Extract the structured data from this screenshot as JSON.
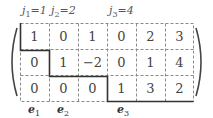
{
  "pivot_labels": [
    {
      "var": "j",
      "sub": "1",
      "eq": "=1",
      "x": 22
    },
    {
      "var": "j",
      "sub": "2",
      "eq": "=2",
      "x": 51
    },
    {
      "var": "j",
      "sub": "3",
      "eq": "=4",
      "x": 109
    }
  ],
  "matrix": {
    "rows": [
      [
        "1",
        "0",
        "1",
        "0",
        "2",
        "3"
      ],
      [
        "0",
        "1",
        "−2",
        "0",
        "1",
        "4"
      ],
      [
        "0",
        "0",
        "0",
        "1",
        "3",
        "2"
      ]
    ]
  },
  "basis_labels": [
    {
      "var": "e",
      "sub": "1",
      "x": 28
    },
    {
      "var": "e",
      "sub": "2",
      "x": 57
    },
    {
      "var": "e",
      "sub": "3",
      "x": 117
    }
  ],
  "colors": {
    "dashed_grid": "#888888",
    "staircase": "#333333",
    "parens": "#444444"
  }
}
